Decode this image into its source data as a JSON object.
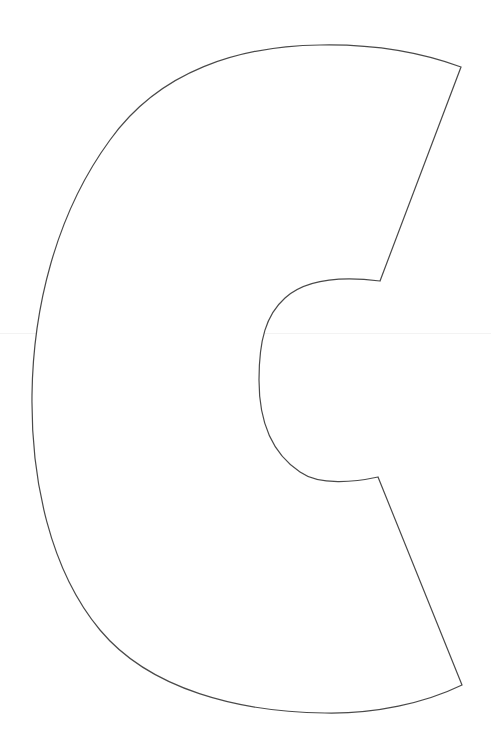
{
  "figure": {
    "letter": "C",
    "stroke_color": "#4a4a4a",
    "fill_color": "#ffffff",
    "background_color": "#ffffff",
    "guide_line_color": "#f3f3f3"
  }
}
